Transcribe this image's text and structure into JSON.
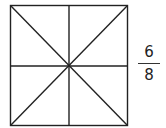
{
  "diagram": {
    "shape": "square",
    "divisions": 8,
    "division_lines": [
      "vertical",
      "horizontal",
      "diagonal-main",
      "diagonal-anti"
    ],
    "stroke_color": "#222222",
    "fill_color": "#ffffff"
  },
  "fraction": {
    "numerator": "6",
    "denominator": "8"
  }
}
